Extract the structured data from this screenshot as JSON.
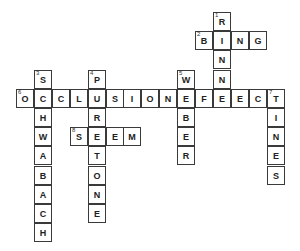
{
  "puzzle": {
    "type": "crossword",
    "cell_width": 17.9,
    "cell_height": 19.2,
    "origin_x": 16,
    "origin_y": 12,
    "entries": [
      {
        "number": 1,
        "direction": "down",
        "answer": "RINNE",
        "row": 0,
        "col": 11
      },
      {
        "number": 2,
        "direction": "across",
        "answer": "BING",
        "row": 1,
        "col": 10
      },
      {
        "number": 3,
        "direction": "down",
        "answer": "SCHWABACH",
        "row": 3,
        "col": 1
      },
      {
        "number": 4,
        "direction": "down",
        "answer": "PURETONE",
        "row": 3,
        "col": 4
      },
      {
        "number": 5,
        "direction": "down",
        "answer": "WEBER",
        "row": 3,
        "col": 9
      },
      {
        "number": 6,
        "direction": "across",
        "answer": "OCCLUSIONEFFECT",
        "row": 4,
        "col": 0
      },
      {
        "number": 7,
        "direction": "down",
        "answer": "TINES",
        "row": 4,
        "col": 14
      },
      {
        "number": 8,
        "direction": "across",
        "answer": "STEM",
        "row": 6,
        "col": 3
      }
    ]
  }
}
